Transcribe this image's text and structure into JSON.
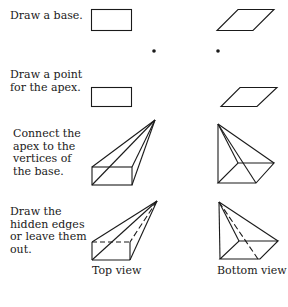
{
  "steps": [
    {
      "id": "base",
      "text": "Draw a base."
    },
    {
      "id": "apex",
      "text": "Draw a point\nfor the apex."
    },
    {
      "id": "connect",
      "text": "Connect the\napex to the\nvertices of\nthe base."
    },
    {
      "id": "hidden",
      "text": "Draw the\nhidden edges\nor leave them\nout."
    }
  ],
  "captions": {
    "top_view": "Top view",
    "bottom_view": "Bottom view"
  },
  "colors": {
    "line": "#1a1a1a",
    "background": "#ffffff"
  }
}
